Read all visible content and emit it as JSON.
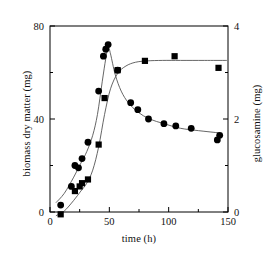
{
  "chart_data": {
    "type": "scatter",
    "title": "",
    "xlabel": "time (h)",
    "ylabel": "biomass dry matter (mg)",
    "ylabel_right": "glucosamine (mg)",
    "xlim": [
      0,
      150
    ],
    "ylim": [
      0,
      80
    ],
    "ylim_right": [
      0,
      4
    ],
    "xticks": [
      "0",
      "50",
      "100",
      "150"
    ],
    "xtick_values": [
      0,
      50,
      100,
      150
    ],
    "yticks_left": [
      "0",
      "40",
      "80"
    ],
    "ytick_values_left": [
      0,
      40,
      80
    ],
    "yticks_right": [
      "0",
      "2",
      "4"
    ],
    "ytick_values_right": [
      0,
      2,
      4
    ],
    "grid": false,
    "legend": "none",
    "series": [
      {
        "name": "biomass dry matter",
        "marker": "circle",
        "axis": "left",
        "units": "mg",
        "x": [
          9,
          18,
          21,
          24,
          27,
          32,
          41,
          45,
          47,
          49,
          57,
          68,
          74,
          83,
          96,
          106,
          119,
          141,
          143
        ],
        "values": [
          3,
          11,
          20,
          19,
          23,
          30,
          52,
          67,
          70,
          72,
          61,
          47,
          44,
          40,
          38,
          37,
          36,
          31,
          33
        ]
      },
      {
        "name": "glucosamine",
        "marker": "square",
        "axis": "right",
        "units": "mg",
        "x": [
          9,
          21,
          25,
          27,
          32,
          41,
          46,
          57,
          80,
          105,
          142
        ],
        "values": [
          -0.05,
          0.45,
          0.55,
          0.62,
          0.7,
          1.45,
          2.45,
          3.05,
          3.25,
          3.35,
          3.1
        ]
      }
    ],
    "fit_curves": [
      {
        "name": "biomass fit",
        "axis": "left",
        "x": [
          5,
          12,
          20,
          26,
          31,
          36,
          40,
          44,
          47,
          49,
          51,
          55,
          60,
          66,
          74,
          84,
          96,
          110,
          125,
          143
        ],
        "values": [
          4,
          8,
          15,
          21,
          26,
          33,
          42,
          56,
          66,
          71,
          68,
          59,
          52,
          47,
          43,
          40,
          38,
          36,
          35,
          34
        ]
      },
      {
        "name": "glucosamine fit",
        "axis": "right",
        "x": [
          5,
          12,
          20,
          26,
          31,
          36,
          41,
          46,
          51,
          57,
          64,
          72,
          82,
          95,
          110,
          130,
          149
        ],
        "values": [
          -0.08,
          0.02,
          0.25,
          0.45,
          0.62,
          0.9,
          1.4,
          2.1,
          2.65,
          2.98,
          3.14,
          3.22,
          3.25,
          3.26,
          3.26,
          3.26,
          3.26
        ]
      }
    ],
    "colors": {
      "marker": "#000000",
      "curve": "#555555",
      "axis": "#000000",
      "background": "#ffffff"
    }
  }
}
